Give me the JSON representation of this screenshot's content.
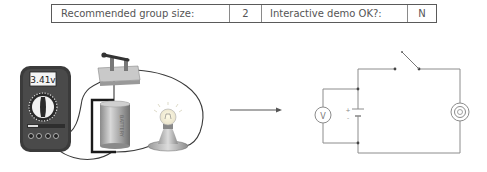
{
  "info_table": {
    "group_size_label": "Recommended group size:",
    "group_size_value": "2",
    "interactive_label": "Interactive demo OK?:",
    "interactive_value": "N"
  },
  "illustration": {
    "multimeter_reading": "3.41v",
    "battery_label": "BATTERY",
    "icons": [
      "multimeter-icon",
      "knife-switch-icon",
      "battery-icon",
      "light-bulb-icon",
      "arrow-right-icon"
    ]
  },
  "schematic": {
    "voltmeter_symbol": "V",
    "battery_plus": "+",
    "battery_minus": "-",
    "components": [
      "voltmeter",
      "battery",
      "open-switch",
      "lamp"
    ]
  },
  "colors": {
    "wire": "#3a3a3a",
    "schematic_line": "#8c8c8c",
    "multimeter_body": "#3b3b3b",
    "battery": "#a9a9a9"
  }
}
